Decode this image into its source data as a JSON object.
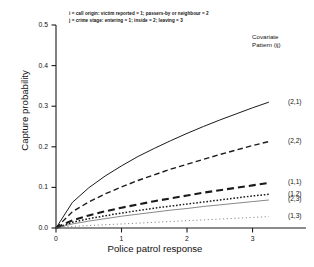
{
  "chart_data": {
    "type": "line",
    "title": "",
    "xlabel": "Police patrol response",
    "ylabel": "Capture probability",
    "xlim": [
      0,
      3.45
    ],
    "ylim": [
      0,
      0.5
    ],
    "xticks": [
      "0",
      "1",
      "2",
      "3"
    ],
    "xtick_values": [
      0,
      1,
      2,
      3
    ],
    "yticks": [
      "0.0",
      "0.1",
      "0.2",
      "0.3",
      "0.4",
      "0.5"
    ],
    "ytick_values": [
      0.0,
      0.1,
      0.2,
      0.3,
      0.4,
      0.5
    ],
    "grid": false,
    "legend_position": "right-inline-labels",
    "legend_title_line1": "Covariate",
    "legend_title_line2": "Pattern (ij)",
    "annotations": [
      "i = call origin: victim reported = 1; passers-by or neighbour = 2",
      "j = crime stage: entering = 1; inside = 2; leaving = 3"
    ],
    "x": [
      0,
      0.25,
      0.5,
      0.75,
      1.0,
      1.25,
      1.5,
      1.75,
      2.0,
      2.25,
      2.5,
      2.75,
      3.0,
      3.25
    ],
    "series": [
      {
        "name": "(2,1)",
        "label": "(2,1)",
        "style": "solid",
        "width": 1.0,
        "color": "#1a1a1a",
        "values": [
          0.0,
          0.063,
          0.099,
          0.128,
          0.153,
          0.176,
          0.196,
          0.215,
          0.233,
          0.25,
          0.266,
          0.281,
          0.296,
          0.31
        ]
      },
      {
        "name": "(2,2)",
        "label": "(2,2)",
        "style": "dashed",
        "width": 1.4,
        "color": "#1a1a1a",
        "values": [
          0.0,
          0.04,
          0.064,
          0.084,
          0.101,
          0.117,
          0.131,
          0.145,
          0.157,
          0.169,
          0.181,
          0.192,
          0.203,
          0.213
        ]
      },
      {
        "name": "(1,1)",
        "label": "(1,1)",
        "style": "long-dash",
        "width": 2.1,
        "color": "#1a1a1a",
        "values": [
          0.0,
          0.019,
          0.031,
          0.041,
          0.05,
          0.058,
          0.066,
          0.073,
          0.08,
          0.087,
          0.093,
          0.099,
          0.105,
          0.111
        ]
      },
      {
        "name": "(1,2)",
        "label": "(1,2)",
        "style": "dotted",
        "width": 1.5,
        "color": "#1a1a1a",
        "values": [
          0.0,
          0.014,
          0.023,
          0.03,
          0.037,
          0.043,
          0.049,
          0.054,
          0.059,
          0.064,
          0.069,
          0.074,
          0.079,
          0.083
        ]
      },
      {
        "name": "(2,3)",
        "label": "(2,3)",
        "style": "thin-solid",
        "width": 0.7,
        "color": "#555555",
        "values": [
          0.0,
          0.01,
          0.017,
          0.023,
          0.029,
          0.034,
          0.039,
          0.044,
          0.048,
          0.053,
          0.057,
          0.061,
          0.065,
          0.069
        ]
      },
      {
        "name": "(1,3)",
        "label": "(1,3)",
        "style": "fine-dot",
        "width": 0.7,
        "color": "#555555",
        "values": [
          0.0,
          0.004,
          0.006,
          0.008,
          0.01,
          0.012,
          0.014,
          0.016,
          0.018,
          0.02,
          0.022,
          0.024,
          0.026,
          0.028
        ]
      }
    ]
  },
  "axes": {
    "ylabel": "Capture probability",
    "xlabel": "Police patrol response",
    "ytick_labels": [
      "0.5",
      "0.4",
      "0.3",
      "0.2",
      "0.1",
      "0.0"
    ],
    "xtick_labels": [
      "0",
      "1",
      "2",
      "3"
    ]
  },
  "legend": {
    "title_line1": "Covariate",
    "title_line2": "Pattern (ij)",
    "items": [
      "(2,1)",
      "(2,2)",
      "(1,1)",
      "(1,2)",
      "(2,3)",
      "(1,3)"
    ]
  },
  "notes": {
    "line1": "i = call origin: victim reported = 1; passers-by or neighbour = 2",
    "line2": "j = crime stage: entering = 1; inside = 2; leaving = 3"
  }
}
